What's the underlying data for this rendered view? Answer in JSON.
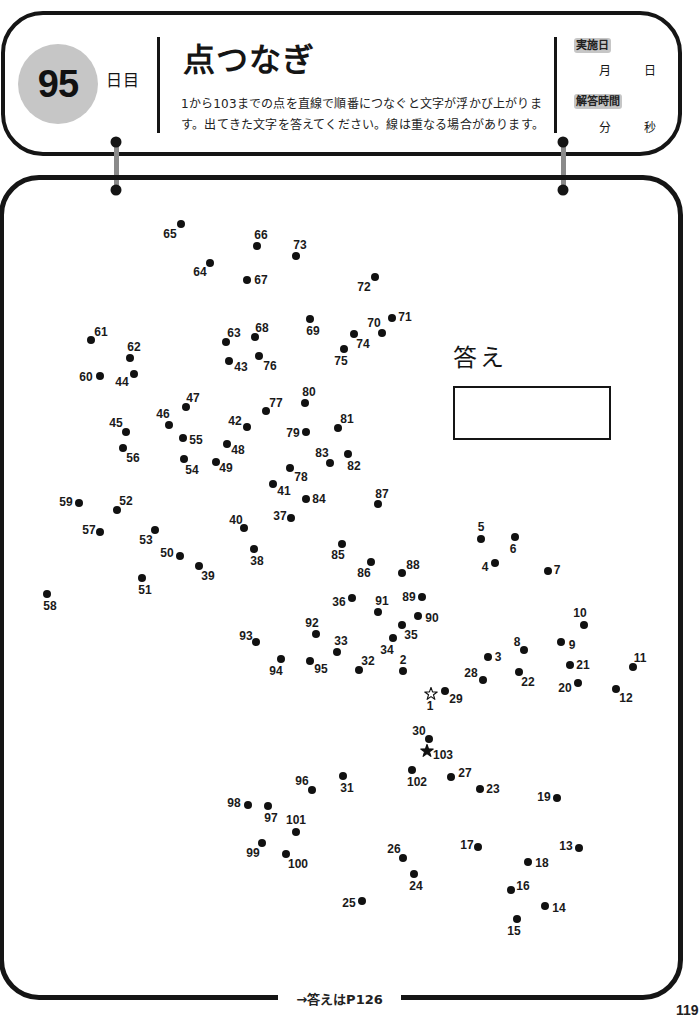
{
  "header": {
    "day_number": "95",
    "day_suffix": "日目",
    "title": "点つなぎ",
    "description_lines": [
      "1から103までの点を直線で順番につなぐと文字が浮かび上がりま",
      "す。出てきた文字を答えてください。線は重なる場合があります。"
    ],
    "date_badge": "実施日",
    "month_unit": "月",
    "day_unit": "日",
    "time_badge": "解答時間",
    "minute_unit": "分",
    "second_unit": "秒"
  },
  "answer": {
    "label": "答え",
    "value": ""
  },
  "footer": {
    "answer_reference": "→答えはP126",
    "page_number": "119"
  },
  "colors": {
    "ink": "#151515",
    "gray": "#c6c6c6",
    "connector": "#8a8a8a",
    "paper": "#ffffff"
  },
  "puzzle": {
    "range": [
      1,
      103
    ],
    "start_marker": "star-outline",
    "end_marker": "star-filled",
    "dots": [
      {
        "n": 1,
        "x": 431,
        "y": 694,
        "lx": 430,
        "ly": 706,
        "shape": "star-outline"
      },
      {
        "n": 2,
        "x": 403,
        "y": 671,
        "lx": 403,
        "ly": 660
      },
      {
        "n": 3,
        "x": 488,
        "y": 657,
        "lx": 498,
        "ly": 657
      },
      {
        "n": 4,
        "x": 495,
        "y": 563,
        "lx": 485,
        "ly": 567
      },
      {
        "n": 5,
        "x": 481,
        "y": 539,
        "lx": 481,
        "ly": 527
      },
      {
        "n": 6,
        "x": 515,
        "y": 537,
        "lx": 513,
        "ly": 549
      },
      {
        "n": 7,
        "x": 548,
        "y": 571,
        "lx": 557,
        "ly": 570
      },
      {
        "n": 8,
        "x": 524,
        "y": 650,
        "lx": 517,
        "ly": 642
      },
      {
        "n": 9,
        "x": 561,
        "y": 642,
        "lx": 572,
        "ly": 645
      },
      {
        "n": 10,
        "x": 584,
        "y": 625,
        "lx": 580,
        "ly": 613
      },
      {
        "n": 11,
        "x": 633,
        "y": 667,
        "lx": 640,
        "ly": 658
      },
      {
        "n": 12,
        "x": 616,
        "y": 689,
        "lx": 626,
        "ly": 698
      },
      {
        "n": 13,
        "x": 579,
        "y": 848,
        "lx": 566,
        "ly": 846
      },
      {
        "n": 14,
        "x": 545,
        "y": 906,
        "lx": 559,
        "ly": 908
      },
      {
        "n": 15,
        "x": 517,
        "y": 919,
        "lx": 514,
        "ly": 931
      },
      {
        "n": 16,
        "x": 511,
        "y": 890,
        "lx": 523,
        "ly": 886
      },
      {
        "n": 17,
        "x": 478,
        "y": 847,
        "lx": 467,
        "ly": 845
      },
      {
        "n": 18,
        "x": 528,
        "y": 862,
        "lx": 542,
        "ly": 863
      },
      {
        "n": 19,
        "x": 557,
        "y": 798,
        "lx": 544,
        "ly": 797
      },
      {
        "n": 20,
        "x": 578,
        "y": 683,
        "lx": 565,
        "ly": 688
      },
      {
        "n": 21,
        "x": 570,
        "y": 665,
        "lx": 583,
        "ly": 665
      },
      {
        "n": 22,
        "x": 519,
        "y": 672,
        "lx": 528,
        "ly": 682
      },
      {
        "n": 23,
        "x": 480,
        "y": 789,
        "lx": 493,
        "ly": 789
      },
      {
        "n": 24,
        "x": 414,
        "y": 874,
        "lx": 416,
        "ly": 886
      },
      {
        "n": 25,
        "x": 362,
        "y": 901,
        "lx": 349,
        "ly": 903
      },
      {
        "n": 26,
        "x": 403,
        "y": 858,
        "lx": 394,
        "ly": 849
      },
      {
        "n": 27,
        "x": 451,
        "y": 777,
        "lx": 465,
        "ly": 773
      },
      {
        "n": 28,
        "x": 483,
        "y": 680,
        "lx": 471,
        "ly": 673
      },
      {
        "n": 29,
        "x": 445,
        "y": 691,
        "lx": 456,
        "ly": 699
      },
      {
        "n": 30,
        "x": 429,
        "y": 739,
        "lx": 419,
        "ly": 731
      },
      {
        "n": 31,
        "x": 343,
        "y": 776,
        "lx": 347,
        "ly": 788
      },
      {
        "n": 32,
        "x": 359,
        "y": 670,
        "lx": 368,
        "ly": 661
      },
      {
        "n": 33,
        "x": 337,
        "y": 652,
        "lx": 341,
        "ly": 641
      },
      {
        "n": 34,
        "x": 393,
        "y": 638,
        "lx": 387,
        "ly": 650
      },
      {
        "n": 35,
        "x": 402,
        "y": 625,
        "lx": 411,
        "ly": 635
      },
      {
        "n": 36,
        "x": 352,
        "y": 598,
        "lx": 339,
        "ly": 602
      },
      {
        "n": 37,
        "x": 291,
        "y": 518,
        "lx": 280,
        "ly": 516
      },
      {
        "n": 38,
        "x": 254,
        "y": 549,
        "lx": 257,
        "ly": 561
      },
      {
        "n": 39,
        "x": 199,
        "y": 566,
        "lx": 208,
        "ly": 576
      },
      {
        "n": 40,
        "x": 244,
        "y": 528,
        "lx": 236,
        "ly": 520
      },
      {
        "n": 41,
        "x": 273,
        "y": 484,
        "lx": 284,
        "ly": 491
      },
      {
        "n": 42,
        "x": 247,
        "y": 427,
        "lx": 235,
        "ly": 421
      },
      {
        "n": 43,
        "x": 229,
        "y": 361,
        "lx": 241,
        "ly": 367
      },
      {
        "n": 44,
        "x": 134,
        "y": 374,
        "lx": 122,
        "ly": 382
      },
      {
        "n": 45,
        "x": 126,
        "y": 432,
        "lx": 116,
        "ly": 423
      },
      {
        "n": 46,
        "x": 169,
        "y": 425,
        "lx": 163,
        "ly": 414
      },
      {
        "n": 47,
        "x": 186,
        "y": 407,
        "lx": 193,
        "ly": 398
      },
      {
        "n": 48,
        "x": 227,
        "y": 444,
        "lx": 238,
        "ly": 450
      },
      {
        "n": 49,
        "x": 216,
        "y": 462,
        "lx": 226,
        "ly": 468
      },
      {
        "n": 50,
        "x": 180,
        "y": 556,
        "lx": 167,
        "ly": 553
      },
      {
        "n": 51,
        "x": 142,
        "y": 578,
        "lx": 145,
        "ly": 590
      },
      {
        "n": 52,
        "x": 117,
        "y": 510,
        "lx": 126,
        "ly": 501
      },
      {
        "n": 53,
        "x": 155,
        "y": 530,
        "lx": 146,
        "ly": 540
      },
      {
        "n": 54,
        "x": 184,
        "y": 459,
        "lx": 192,
        "ly": 470
      },
      {
        "n": 55,
        "x": 183,
        "y": 438,
        "lx": 196,
        "ly": 440
      },
      {
        "n": 56,
        "x": 123,
        "y": 448,
        "lx": 133,
        "ly": 458
      },
      {
        "n": 57,
        "x": 100,
        "y": 532,
        "lx": 89,
        "ly": 530
      },
      {
        "n": 58,
        "x": 47,
        "y": 594,
        "lx": 50,
        "ly": 606
      },
      {
        "n": 59,
        "x": 79,
        "y": 503,
        "lx": 66,
        "ly": 502
      },
      {
        "n": 60,
        "x": 100,
        "y": 376,
        "lx": 86,
        "ly": 377
      },
      {
        "n": 61,
        "x": 91,
        "y": 340,
        "lx": 101,
        "ly": 332
      },
      {
        "n": 62,
        "x": 130,
        "y": 358,
        "lx": 134,
        "ly": 347
      },
      {
        "n": 63,
        "x": 226,
        "y": 342,
        "lx": 234,
        "ly": 333
      },
      {
        "n": 64,
        "x": 210,
        "y": 263,
        "lx": 200,
        "ly": 272
      },
      {
        "n": 65,
        "x": 181,
        "y": 224,
        "lx": 170,
        "ly": 234
      },
      {
        "n": 66,
        "x": 257,
        "y": 246,
        "lx": 261,
        "ly": 235
      },
      {
        "n": 67,
        "x": 247,
        "y": 280,
        "lx": 261,
        "ly": 280
      },
      {
        "n": 68,
        "x": 255,
        "y": 337,
        "lx": 262,
        "ly": 328
      },
      {
        "n": 69,
        "x": 310,
        "y": 319,
        "lx": 313,
        "ly": 331
      },
      {
        "n": 70,
        "x": 382,
        "y": 333,
        "lx": 374,
        "ly": 323
      },
      {
        "n": 71,
        "x": 392,
        "y": 318,
        "lx": 405,
        "ly": 317
      },
      {
        "n": 72,
        "x": 375,
        "y": 277,
        "lx": 364,
        "ly": 287
      },
      {
        "n": 73,
        "x": 296,
        "y": 256,
        "lx": 300,
        "ly": 245
      },
      {
        "n": 74,
        "x": 354,
        "y": 334,
        "lx": 363,
        "ly": 344
      },
      {
        "n": 75,
        "x": 344,
        "y": 349,
        "lx": 341,
        "ly": 361
      },
      {
        "n": 76,
        "x": 259,
        "y": 356,
        "lx": 270,
        "ly": 366
      },
      {
        "n": 77,
        "x": 266,
        "y": 411,
        "lx": 276,
        "ly": 403
      },
      {
        "n": 78,
        "x": 290,
        "y": 468,
        "lx": 301,
        "ly": 477
      },
      {
        "n": 79,
        "x": 306,
        "y": 432,
        "lx": 293,
        "ly": 433
      },
      {
        "n": 80,
        "x": 305,
        "y": 403,
        "lx": 309,
        "ly": 392
      },
      {
        "n": 81,
        "x": 338,
        "y": 428,
        "lx": 347,
        "ly": 419
      },
      {
        "n": 82,
        "x": 348,
        "y": 454,
        "lx": 354,
        "ly": 466
      },
      {
        "n": 83,
        "x": 330,
        "y": 463,
        "lx": 322,
        "ly": 453
      },
      {
        "n": 84,
        "x": 306,
        "y": 499,
        "lx": 319,
        "ly": 499
      },
      {
        "n": 85,
        "x": 342,
        "y": 544,
        "lx": 338,
        "ly": 555
      },
      {
        "n": 86,
        "x": 371,
        "y": 562,
        "lx": 364,
        "ly": 573
      },
      {
        "n": 87,
        "x": 378,
        "y": 504,
        "lx": 382,
        "ly": 494
      },
      {
        "n": 88,
        "x": 402,
        "y": 573,
        "lx": 413,
        "ly": 565
      },
      {
        "n": 89,
        "x": 422,
        "y": 597,
        "lx": 409,
        "ly": 597
      },
      {
        "n": 90,
        "x": 418,
        "y": 616,
        "lx": 432,
        "ly": 618
      },
      {
        "n": 91,
        "x": 378,
        "y": 612,
        "lx": 382,
        "ly": 601
      },
      {
        "n": 92,
        "x": 316,
        "y": 634,
        "lx": 312,
        "ly": 623
      },
      {
        "n": 93,
        "x": 256,
        "y": 642,
        "lx": 246,
        "ly": 636
      },
      {
        "n": 94,
        "x": 281,
        "y": 659,
        "lx": 276,
        "ly": 671
      },
      {
        "n": 95,
        "x": 310,
        "y": 661,
        "lx": 321,
        "ly": 669
      },
      {
        "n": 96,
        "x": 312,
        "y": 790,
        "lx": 302,
        "ly": 781
      },
      {
        "n": 97,
        "x": 268,
        "y": 806,
        "lx": 271,
        "ly": 818
      },
      {
        "n": 98,
        "x": 248,
        "y": 805,
        "lx": 234,
        "ly": 803
      },
      {
        "n": 99,
        "x": 262,
        "y": 843,
        "lx": 253,
        "ly": 853
      },
      {
        "n": 100,
        "x": 286,
        "y": 854,
        "lx": 298,
        "ly": 864
      },
      {
        "n": 101,
        "x": 296,
        "y": 832,
        "lx": 296,
        "ly": 820
      },
      {
        "n": 102,
        "x": 412,
        "y": 770,
        "lx": 417,
        "ly": 782
      },
      {
        "n": 103,
        "x": 427,
        "y": 751,
        "lx": 443,
        "ly": 755,
        "shape": "star-filled"
      }
    ]
  }
}
